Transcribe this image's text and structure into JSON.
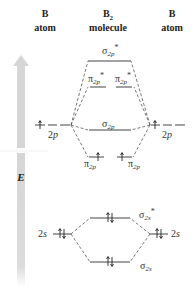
{
  "headers": {
    "left_atom": {
      "line1": "B",
      "line2": "atom"
    },
    "molecule": {
      "line1": "B",
      "line1_sub": "2",
      "line2": "molecule"
    },
    "right_atom": {
      "line1": "B",
      "line2": "atom"
    }
  },
  "energy_axis": {
    "label": "E",
    "icon": "up-arrow-icon",
    "color": "#d8d8d8"
  },
  "atomic_orbitals": {
    "left": [
      {
        "name": "2p",
        "main": "2",
        "italic": "p",
        "electrons": 1,
        "orbitals": 3
      },
      {
        "name": "2s",
        "main": "2",
        "italic": "s",
        "electrons": 2,
        "orbitals": 1
      }
    ],
    "right": [
      {
        "name": "2p",
        "main": "2",
        "italic": "p",
        "electrons": 1,
        "orbitals": 3
      },
      {
        "name": "2s",
        "main": "2",
        "italic": "s",
        "electrons": 2,
        "orbitals": 1
      }
    ]
  },
  "molecular_orbitals": [
    {
      "id": "sigma2p_star",
      "symbol": "σ",
      "sub": "2p",
      "star": "*",
      "electrons": 0
    },
    {
      "id": "pi2p_star_a",
      "symbol": "π",
      "sub": "2p",
      "star": "*",
      "electrons": 0
    },
    {
      "id": "pi2p_star_b",
      "symbol": "π",
      "sub": "2p",
      "star": "*",
      "electrons": 0
    },
    {
      "id": "sigma2p",
      "symbol": "σ",
      "sub": "2p",
      "star": "",
      "electrons": 0
    },
    {
      "id": "pi2p_a",
      "symbol": "π",
      "sub": "2p",
      "star": "",
      "electrons": 1
    },
    {
      "id": "pi2p_b",
      "symbol": "π",
      "sub": "2p",
      "star": "",
      "electrons": 1
    },
    {
      "id": "sigma2s_star",
      "symbol": "σ",
      "sub": "2s",
      "star": "*",
      "electrons": 2
    },
    {
      "id": "sigma2s",
      "symbol": "σ",
      "sub": "2s",
      "star": "",
      "electrons": 2
    }
  ]
}
